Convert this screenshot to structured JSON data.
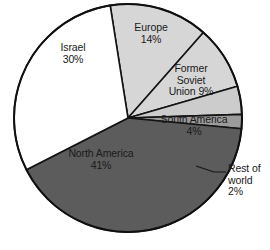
{
  "chart_data": {
    "type": "pie",
    "title": "",
    "subtitle": "",
    "xlabel": "",
    "ylabel": "",
    "legend_position": "none",
    "grid": false,
    "labels_inside": true,
    "total_percent": 100,
    "categories": [
      "North America",
      "Israel",
      "Europe",
      "Former Soviet Union",
      "South America",
      "Rest of world"
    ],
    "values": [
      41,
      30,
      14,
      9,
      4,
      2
    ],
    "slices": [
      {
        "name": "Europe",
        "label_line1": "Europe",
        "label_line2": "14%",
        "value": 14,
        "unit": "%",
        "color": "#d6d6d6",
        "start_angle": -9,
        "end_angle": 41.4,
        "label_placement": "inside"
      },
      {
        "name": "Former Soviet Union",
        "label_line1": "Former",
        "label_line2": "Soviet",
        "label_line3": "Union 9%",
        "value": 9,
        "unit": "%",
        "color": "#d6d6d6",
        "start_angle": 41.4,
        "end_angle": 73.8,
        "label_placement": "inside"
      },
      {
        "name": "South America",
        "label_line1": "South America",
        "label_line2": "4%",
        "value": 4,
        "unit": "%",
        "color": "#cccccc",
        "start_angle": 73.8,
        "end_angle": 88.2,
        "label_placement": "inside"
      },
      {
        "name": "Rest of world",
        "label_line1": "Rest of",
        "label_line2": "world",
        "label_line3": "2%",
        "value": 2,
        "unit": "%",
        "color": "#9b9b9b",
        "start_angle": 88.2,
        "end_angle": 95.4,
        "label_placement": "outside-leader"
      },
      {
        "name": "North America",
        "label_line1": "North America",
        "label_line2": "41%",
        "value": 41,
        "unit": "%",
        "color": "#5c5c5c",
        "start_angle": 95.4,
        "end_angle": 243,
        "label_placement": "inside"
      },
      {
        "name": "Israel",
        "label_line1": "Israel",
        "label_line2": "30%",
        "value": 30,
        "unit": "%",
        "color": "#ffffff",
        "start_angle": 243,
        "end_angle": 351,
        "label_placement": "inside"
      }
    ],
    "colors": {
      "outline": "#101010",
      "divider": "#141414",
      "background": "#ffffff",
      "text": "#1a1a1a"
    }
  }
}
